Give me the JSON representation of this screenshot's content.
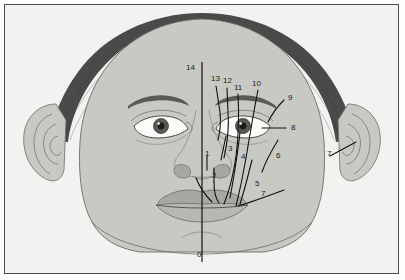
{
  "figure": {
    "type": "anatomical-diagram",
    "background_color": "#f2f2f0",
    "border_color": "#4a4a4a",
    "skin_color": "#c9c9c4",
    "hair_color": "#4a4a4a",
    "feature_fill_color": "#a8a8a2",
    "line_color": "#111111",
    "label_color": "#1a1a1a"
  },
  "annotations": [
    {
      "id": "label-0",
      "text": "0",
      "x": 197,
      "y": 251
    },
    {
      "id": "label-1",
      "text": "1",
      "x": 205,
      "y": 150
    },
    {
      "id": "label-2",
      "text": "2",
      "x": 212,
      "y": 172
    },
    {
      "id": "label-3",
      "text": "3",
      "x": 228,
      "y": 145
    },
    {
      "id": "label-4",
      "text": "4",
      "x": 241,
      "y": 153
    },
    {
      "id": "label-5",
      "text": "5",
      "x": 255,
      "y": 180
    },
    {
      "id": "label-6",
      "text": "6",
      "x": 276,
      "y": 152
    },
    {
      "id": "label-7",
      "text": "7",
      "x": 261,
      "y": 190
    },
    {
      "id": "label-7b",
      "text": "7",
      "x": 327,
      "y": 150
    },
    {
      "id": "label-8",
      "text": "8",
      "x": 291,
      "y": 127
    },
    {
      "id": "label-9",
      "text": "9",
      "x": 288,
      "y": 95
    },
    {
      "id": "label-10",
      "text": "10",
      "x": 254,
      "y": 82
    },
    {
      "id": "label-11",
      "text": "11",
      "x": 236,
      "y": 85
    },
    {
      "id": "label-12",
      "text": "12",
      "x": 224,
      "y": 79
    },
    {
      "id": "label-13",
      "text": "13",
      "x": 212,
      "y": 77
    },
    {
      "id": "label-14",
      "text": "14",
      "x": 187,
      "y": 66
    }
  ]
}
